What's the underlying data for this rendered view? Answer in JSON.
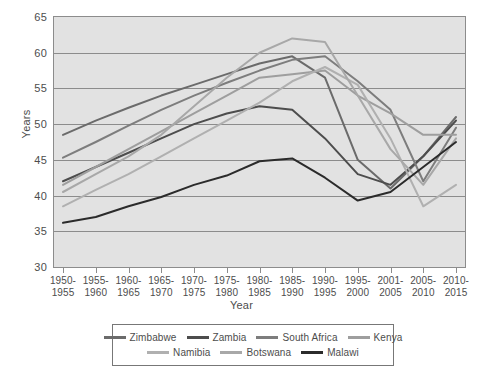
{
  "chart_data": {
    "type": "line",
    "title": "",
    "xlabel": "Year",
    "ylabel": "Years",
    "ylim": [
      30,
      65
    ],
    "ytick_step": 5,
    "grid": true,
    "legend_position": "bottom",
    "yticks": [
      "65",
      "60",
      "55",
      "50",
      "45",
      "40",
      "35",
      "30"
    ],
    "categories": [
      "1950-\n1955",
      "1955-\n1960",
      "1960-\n1965",
      "1965-\n1970",
      "1970-\n1975",
      "1975-\n1980",
      "1980-\n1985",
      "1985-\n1990",
      "1990-\n1995",
      "1995-\n2000",
      "2001-\n2005",
      "2005-\n2010",
      "2010-\n2015"
    ],
    "series": [
      {
        "name": "Zimbabwe",
        "color": "#6b6b6b",
        "values": [
          48.5,
          50.5,
          52.3,
          54.0,
          55.5,
          57.0,
          58.5,
          59.5,
          56.5,
          45.0,
          41.0,
          45.5,
          51.0
        ]
      },
      {
        "name": "Zambia",
        "color": "#4d4d4d",
        "values": [
          42.0,
          44.0,
          46.0,
          48.0,
          50.0,
          51.5,
          52.5,
          52.0,
          48.0,
          43.0,
          41.5,
          45.5,
          50.5
        ]
      },
      {
        "name": "South Africa",
        "color": "#7d7d7d",
        "values": [
          45.3,
          47.5,
          49.8,
          52.0,
          54.0,
          55.8,
          57.5,
          59.0,
          59.5,
          56.0,
          52.0,
          42.0,
          49.5
        ]
      },
      {
        "name": "Kenya",
        "color": "#9e9e9e",
        "values": [
          41.5,
          44.0,
          46.5,
          49.0,
          51.5,
          54.0,
          56.5,
          57.0,
          57.5,
          54.0,
          51.5,
          48.5,
          48.5
        ]
      },
      {
        "name": "Namibia",
        "color": "#b0b0b0",
        "values": [
          38.5,
          40.8,
          43.0,
          45.5,
          48.0,
          50.5,
          53.0,
          56.0,
          58.0,
          55.5,
          48.0,
          38.5,
          41.5
        ]
      },
      {
        "name": "Botswana",
        "color": "#a8a8a8",
        "values": [
          40.5,
          43.0,
          45.5,
          48.5,
          52.5,
          56.5,
          60.0,
          62.0,
          61.5,
          54.0,
          46.5,
          41.5,
          48.0
        ]
      },
      {
        "name": "Malawi",
        "color": "#2b2b2b",
        "values": [
          36.2,
          37.0,
          38.5,
          39.8,
          41.5,
          42.8,
          44.8,
          45.2,
          42.5,
          39.3,
          40.5,
          44.0,
          47.5
        ]
      }
    ]
  },
  "legend": {
    "rows": [
      [
        "Zimbabwe",
        "Zambia",
        "South Africa",
        "Kenya"
      ],
      [
        "Namibia",
        "Botswana",
        "Malawi"
      ]
    ]
  }
}
